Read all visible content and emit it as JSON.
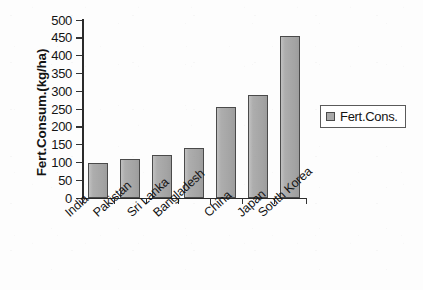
{
  "chart_data": {
    "type": "bar",
    "title": "",
    "subtitle": "",
    "xlabel": "",
    "ylabel": "Fert.Consum.(kg/ha)",
    "categories": [
      "India",
      "Pakistan",
      "Sri Lanka",
      "Bangladesh",
      "China",
      "Japan",
      "South Korea"
    ],
    "values": [
      97,
      110,
      121,
      141,
      256,
      288,
      456
    ],
    "series": [
      {
        "name": "Fert.Cons.",
        "values": [
          97,
          110,
          121,
          141,
          256,
          288,
          456
        ]
      }
    ],
    "ylim": [
      0,
      500
    ],
    "ytick_labels": [
      "500",
      "450",
      "400",
      "350",
      "300",
      "250",
      "200",
      "150",
      "100",
      "50",
      "0"
    ],
    "ytick_values": [
      500,
      450,
      400,
      350,
      300,
      250,
      200,
      150,
      100,
      50,
      0
    ],
    "ytick_step": 50,
    "grid": false,
    "legend": {
      "position": "right",
      "entries": [
        "Fert.Cons."
      ],
      "swatch_color": "#a9a9a9"
    },
    "annotations": [],
    "xtick_label_rotation_deg": -42
  },
  "style": {
    "bar_fill": "#a9a9a9",
    "bar_border": "#4a4a4a",
    "axis_color": "#2b2b2b",
    "text_color": "#141414",
    "background": "#fdfdfd"
  }
}
